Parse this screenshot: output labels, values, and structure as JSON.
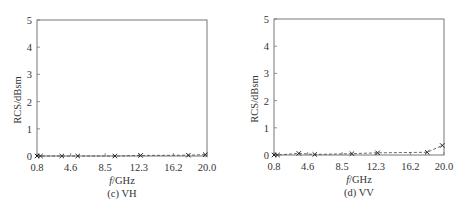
{
  "chart_data": [
    {
      "type": "line",
      "caption": "(c) VH",
      "xlabel": "f/GHz",
      "xlabel_italic_part": "f",
      "xlabel_rest": "/GHz",
      "ylabel": "RCS/dBsm",
      "xlim": [
        0.8,
        20.0
      ],
      "ylim": [
        0,
        5
      ],
      "xticks": [
        "0.8",
        "4.6",
        "8.5",
        "12.3",
        "16.2",
        "20.0"
      ],
      "xtick_values": [
        0.8,
        4.6,
        8.5,
        12.3,
        16.2,
        20.0
      ],
      "yticks": [
        "0",
        "1",
        "2",
        "3",
        "4",
        "5"
      ],
      "ytick_values": [
        0,
        1,
        2,
        3,
        4,
        5
      ],
      "grid": false,
      "series": [
        {
          "name": "VH",
          "marker": "x",
          "line_style": "dashed",
          "x": [
            0.8,
            1.2,
            3.6,
            5.4,
            9.6,
            12.5,
            17.9,
            19.8
          ],
          "y": [
            0.0,
            0.0,
            0.0,
            0.0,
            0.0,
            0.02,
            0.03,
            0.05
          ]
        }
      ]
    },
    {
      "type": "line",
      "caption": "(d) VV",
      "xlabel": "f/GHz",
      "xlabel_italic_part": "f",
      "xlabel_rest": "/GHz",
      "ylabel": "RCS/dBsm",
      "xlim": [
        0.8,
        20.0
      ],
      "ylim": [
        0,
        5
      ],
      "xticks": [
        "0.8",
        "4.6",
        "8.5",
        "12.3",
        "16.2",
        "20.0"
      ],
      "xtick_values": [
        0.8,
        4.6,
        8.5,
        12.3,
        16.2,
        20.0
      ],
      "yticks": [
        "0",
        "1",
        "2",
        "3",
        "4",
        "5"
      ],
      "ytick_values": [
        0,
        1,
        2,
        3,
        4,
        5
      ],
      "grid": false,
      "series": [
        {
          "name": "VV",
          "marker": "x",
          "line_style": "dashed",
          "x": [
            0.8,
            1.2,
            3.6,
            5.4,
            9.6,
            12.5,
            18.1,
            19.8
          ],
          "y": [
            0.0,
            0.0,
            0.06,
            0.02,
            0.05,
            0.08,
            0.1,
            0.35
          ]
        }
      ]
    }
  ]
}
